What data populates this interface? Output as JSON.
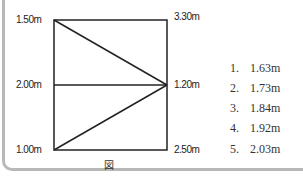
{
  "diagram": {
    "labels": {
      "top_left": "1.50m",
      "mid_left": "2.00m",
      "bottom_left": "1.00m",
      "top_right": "3.30m",
      "mid_right": "1.20m",
      "bottom_right": "2.50m"
    },
    "caption": "図"
  },
  "choices": [
    {
      "num": "1.",
      "value": "1.63m"
    },
    {
      "num": "2.",
      "value": "1.73m"
    },
    {
      "num": "3.",
      "value": "1.84m"
    },
    {
      "num": "4.",
      "value": "1.92m"
    },
    {
      "num": "5.",
      "value": "2.03m"
    }
  ]
}
